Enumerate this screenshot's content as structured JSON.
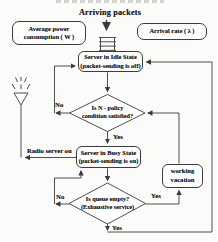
{
  "page": {
    "background": "#fbfbf9",
    "line_color": "#3b3b3b",
    "text_color": "#1f1f1f"
  },
  "flow": {
    "title_top": "Arriving packets",
    "avg_power_line1": "Average power",
    "avg_power_line2": "consumption ( W )",
    "arrival_rate": "Arrival rate ( λ )",
    "idle_line1": "Server in Idle State",
    "idle_line2": "(packet-sending is off)",
    "n_policy_line1": "Is N - policy",
    "n_policy_line2": "condition satisfied?",
    "busy_line1": "Server in Busy State",
    "busy_line2": "(packet-sending is on)",
    "queue_line1": "Is queue empty?",
    "queue_line2": "(Exhaustive service)",
    "wv_line1": "working",
    "wv_line2": "vacation",
    "label_no_n_policy": "No",
    "label_yes_n_policy": "Yes",
    "label_no_queue": "No",
    "label_yes_queue_right": "Yes",
    "label_yes_queue_bottom": "Yes",
    "label_radio": "Radio server on"
  }
}
